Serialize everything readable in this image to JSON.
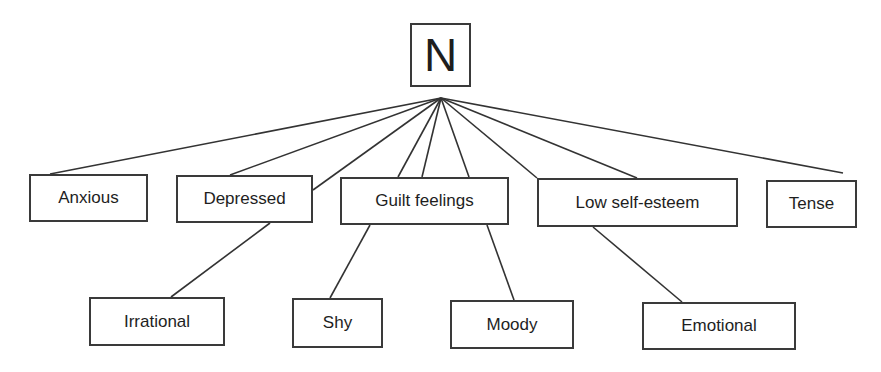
{
  "diagram": {
    "type": "tree",
    "root": {
      "id": "N",
      "label": "N",
      "box": [
        410,
        23,
        61,
        64
      ],
      "anchor": [
        441,
        98
      ]
    },
    "level1": [
      {
        "id": "anxious",
        "label": "Anxious",
        "box": [
          29,
          174,
          119,
          48
        ]
      },
      {
        "id": "depressed",
        "label": "Depressed",
        "box": [
          176,
          175,
          137,
          48
        ]
      },
      {
        "id": "guilt",
        "label": "Guilt feelings",
        "box": [
          340,
          177,
          169,
          48
        ]
      },
      {
        "id": "lowself",
        "label": "Low self-esteem",
        "box": [
          537,
          178,
          201,
          49
        ]
      },
      {
        "id": "tense",
        "label": "Tense",
        "box": [
          766,
          180,
          91,
          48
        ]
      }
    ],
    "level2": [
      {
        "id": "irrational",
        "label": "Irrational",
        "box": [
          89,
          297,
          136,
          49
        ]
      },
      {
        "id": "shy",
        "label": "Shy",
        "box": [
          292,
          298,
          91,
          50
        ]
      },
      {
        "id": "moody",
        "label": "Moody",
        "box": [
          450,
          300,
          124,
          49
        ]
      },
      {
        "id": "emotional",
        "label": "Emotional",
        "box": [
          642,
          302,
          154,
          48
        ]
      }
    ],
    "edges": [
      {
        "from": "N",
        "to": "anxious",
        "line": [
          441,
          98,
          50,
          174
        ]
      },
      {
        "from": "N",
        "to": "depressed",
        "line": [
          441,
          98,
          230,
          175
        ]
      },
      {
        "from": "N",
        "to": "depressed",
        "line": [
          441,
          98,
          313,
          190
        ]
      },
      {
        "from": "N",
        "to": "guilt",
        "line": [
          441,
          98,
          398,
          177
        ]
      },
      {
        "from": "N",
        "to": "guilt",
        "line": [
          441,
          98,
          422,
          177
        ]
      },
      {
        "from": "N",
        "to": "guilt",
        "line": [
          441,
          98,
          469,
          177
        ]
      },
      {
        "from": "N",
        "to": "lowself",
        "line": [
          441,
          98,
          537,
          178
        ]
      },
      {
        "from": "N",
        "to": "lowself",
        "line": [
          441,
          98,
          637,
          178
        ]
      },
      {
        "from": "N",
        "to": "tense",
        "line": [
          441,
          98,
          843,
          173
        ]
      },
      {
        "from": "depressed",
        "to": "irrational",
        "line": [
          270,
          223,
          171,
          297
        ]
      },
      {
        "from": "guilt",
        "to": "shy",
        "line": [
          370,
          225,
          330,
          298
        ]
      },
      {
        "from": "guilt",
        "to": "moody",
        "line": [
          487,
          225,
          514,
          300
        ]
      },
      {
        "from": "lowself",
        "to": "emotional",
        "line": [
          593,
          227,
          682,
          302
        ]
      }
    ],
    "colors": {
      "stroke": "#333333",
      "text": "#1e1e1e",
      "background": "#ffffff"
    }
  }
}
